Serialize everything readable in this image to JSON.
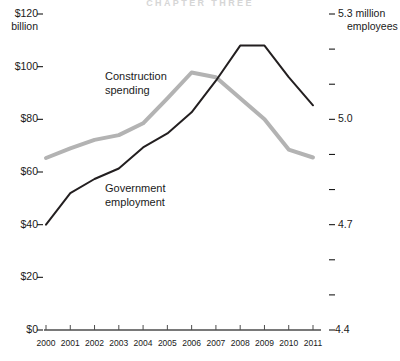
{
  "header": {
    "watermark_title": "CHAPTER THREE"
  },
  "chart_data": {
    "type": "line",
    "title": "",
    "subtitle": "",
    "xlabel": "",
    "categories": [
      "2000",
      "2001",
      "2002",
      "2003",
      "2004",
      "2005",
      "2006",
      "2007",
      "2008",
      "2009",
      "2010",
      "2011"
    ],
    "grid": false,
    "legend_position": "inline-annotations",
    "axes": {
      "left": {
        "label": "$120 billion",
        "unit_text": "billion",
        "ylim": [
          0,
          120
        ],
        "tick_values": [
          0,
          20,
          40,
          60,
          80,
          100,
          120
        ],
        "tick_labels": [
          "$0",
          "$20",
          "$40",
          "$60",
          "$80",
          "$100",
          "$120"
        ],
        "minor_ticks": false
      },
      "right": {
        "label": "5.3 million employees",
        "unit_text": "million employees",
        "ylim": [
          4.4,
          5.3
        ],
        "tick_values": [
          4.4,
          4.5,
          4.6,
          4.7,
          4.8,
          4.9,
          5.0,
          5.1,
          5.2,
          5.3
        ],
        "labeled_ticks": [
          {
            "value": 5.3,
            "label": "5.3 million employees"
          },
          {
            "value": 5.0,
            "label": "5.0"
          },
          {
            "value": 4.7,
            "label": "4.7"
          },
          {
            "value": 4.4,
            "label": "4.4"
          }
        ]
      }
    },
    "series": [
      {
        "name": "Construction spending",
        "axis": "left",
        "color": "#b3b3b3",
        "stroke_width": 4,
        "annotation": {
          "line1": "Construction",
          "line2": "spending"
        },
        "values": [
          65.3,
          69.0,
          72.2,
          74.0,
          78.5,
          88.0,
          97.8,
          96.0,
          88.0,
          80.0,
          68.5,
          65.5
        ]
      },
      {
        "name": "Government employment",
        "axis": "right",
        "color": "#231f20",
        "stroke_width": 2,
        "annotation": {
          "line1": "Government",
          "line2": "employment"
        },
        "values": [
          4.7,
          4.79,
          4.83,
          4.86,
          4.92,
          4.96,
          5.02,
          5.11,
          5.21,
          5.21,
          5.12,
          5.04
        ]
      }
    ]
  }
}
